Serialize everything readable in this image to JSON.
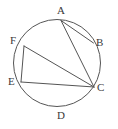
{
  "figure": {
    "kind": "circle-with-inscribed-chords",
    "background_color": "#ffffff",
    "stroke_color": "#555555",
    "label_color": "#3a3a3a",
    "circle": {
      "center_x": 57,
      "center_y": 63,
      "radius": 43.5,
      "stroke_width": 1
    },
    "points": [
      {
        "id": "A",
        "label": "A",
        "x": 61,
        "y": 20.5,
        "label_x": 57,
        "label_y": 5
      },
      {
        "id": "B",
        "label": "B",
        "x": 93.5,
        "y": 43,
        "label_x": 96,
        "label_y": 37
      },
      {
        "id": "C",
        "label": "C",
        "x": 94,
        "y": 87,
        "label_x": 97,
        "label_y": 82
      },
      {
        "id": "D",
        "label": "D",
        "x": 61,
        "y": 106.5,
        "label_x": 57,
        "label_y": 110
      },
      {
        "id": "E",
        "label": "E",
        "x": 21,
        "y": 82,
        "label_x": 8,
        "label_y": 76
      },
      {
        "id": "F",
        "label": "F",
        "x": 24,
        "y": 46,
        "label_x": 10,
        "label_y": 35
      }
    ],
    "chords": [
      {
        "id": "AB",
        "from": "A",
        "to": "B"
      },
      {
        "id": "AC",
        "from": "A",
        "to": "C"
      },
      {
        "id": "FC",
        "from": "F",
        "to": "C"
      },
      {
        "id": "FE",
        "from": "F",
        "to": "E"
      },
      {
        "id": "EC",
        "from": "E",
        "to": "C"
      }
    ]
  }
}
